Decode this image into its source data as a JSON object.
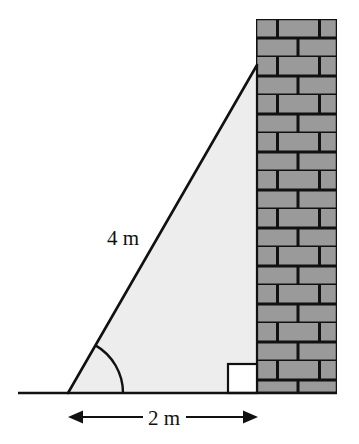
{
  "figure": {
    "type": "geometry-diagram",
    "labels": {
      "hypotenuse": "4 m",
      "base": "2 m"
    },
    "colors": {
      "triangle_fill": "#ededed",
      "brick_fill": "#9a9a9a",
      "mortar": "#111111",
      "stroke": "#111111",
      "right_angle_fill": "#ffffff",
      "background": "#ffffff"
    },
    "geometry": {
      "ground_y": 393,
      "ground_x_start": 18,
      "ground_x_end": 337,
      "triangle_left_vertex": "68,393",
      "triangle_apex": "257,65",
      "triangle_right_base": "257,393",
      "wall_left": 256,
      "wall_right": 337,
      "wall_top": 19,
      "wall_bottom": 393,
      "brick_row_height": 19,
      "angle_arc_radius": 55,
      "right_angle_size": 29,
      "dimension_line_y": 417,
      "dimension_x_start": 68,
      "dimension_x_end": 258
    },
    "icons": {
      "arrow_left": "arrow-left-icon",
      "arrow_right": "arrow-right-icon",
      "angle_arc": "angle-arc-icon",
      "right_angle": "right-angle-marker-icon"
    }
  }
}
